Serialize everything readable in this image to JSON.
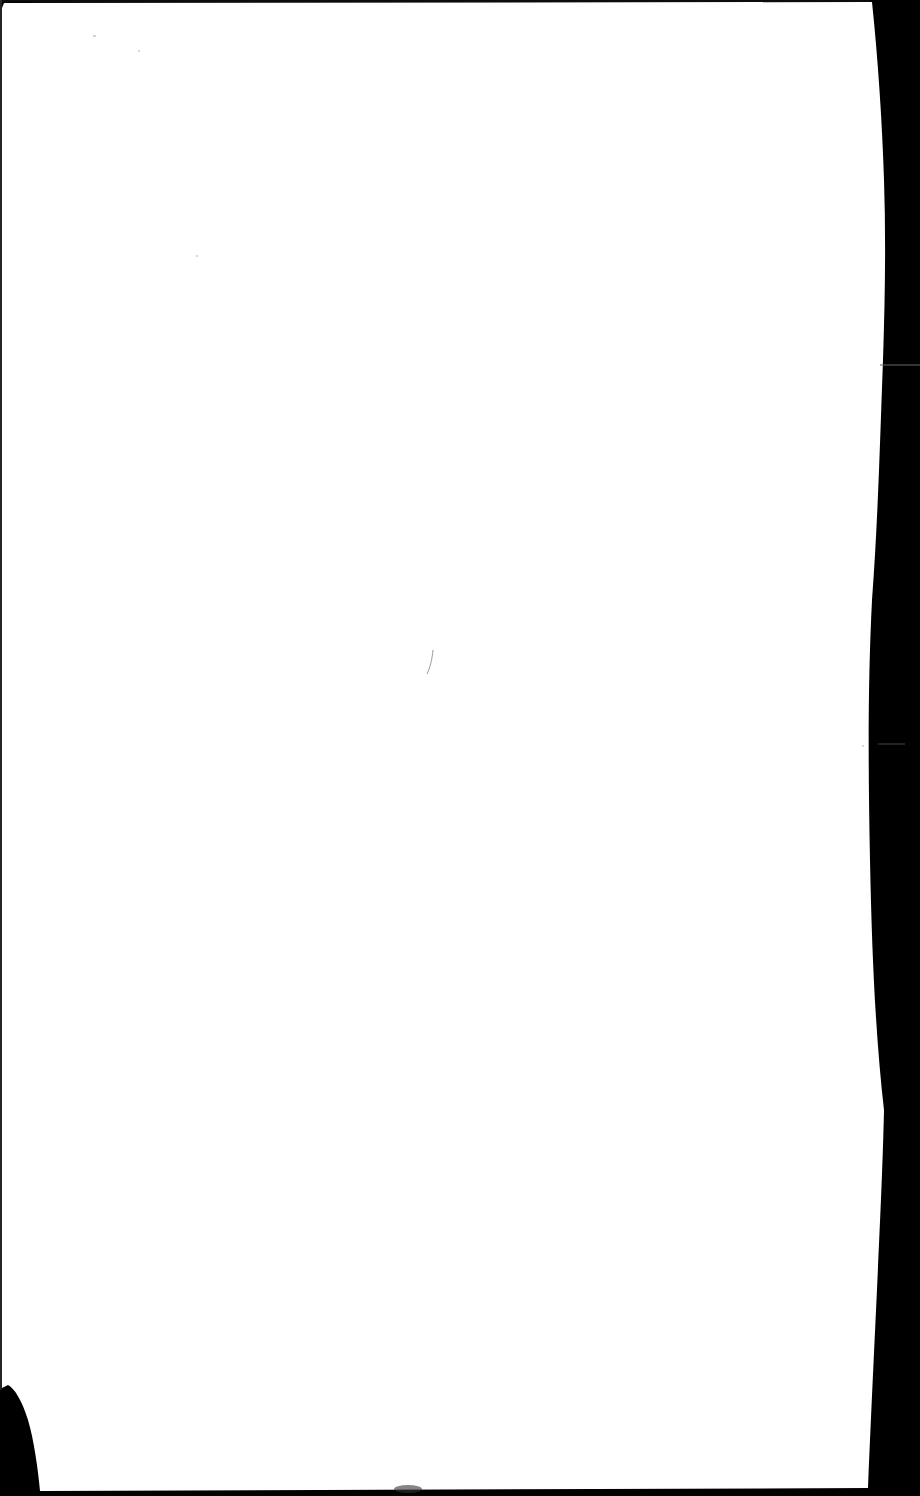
{
  "document": {
    "type": "scanned-page",
    "content": "",
    "page_color": "#ffffff",
    "background_color": "#000000"
  }
}
